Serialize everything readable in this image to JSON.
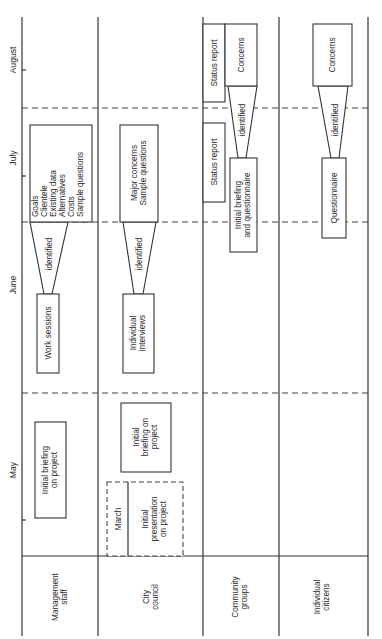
{
  "months": [
    "August",
    "July",
    "June",
    "May"
  ],
  "rows": {
    "management_staff": [
      "Management",
      "staff"
    ],
    "city_council": [
      "City",
      "council"
    ],
    "community_groups": [
      "Community",
      "groups"
    ],
    "individual_citizens": [
      "Individual",
      "citizens"
    ]
  },
  "management_staff": {
    "july_box": [
      "Goals",
      "Clientele",
      "Existing data",
      "Alternatives",
      "Costs",
      "Sample questions"
    ],
    "identified": "identified",
    "june_box": "Work sessions",
    "may_box": [
      "Initial briefing",
      "on project"
    ]
  },
  "city_council": {
    "july_box": [
      "Major concerns",
      "Sample questions"
    ],
    "identified": "identified",
    "june_box": [
      "Individual",
      "interviews"
    ],
    "may_box": [
      "Initial",
      "briefing on",
      "project"
    ],
    "march_label": "March",
    "march_box": [
      "Initial",
      "presentation",
      "on project"
    ]
  },
  "community_groups": {
    "status_report_august": "Status report",
    "concerns": "Concerns",
    "identified": "identified",
    "status_report_july": "Status report",
    "july_box": [
      "Initial briefing",
      "and questionnaire"
    ]
  },
  "individual_citizens": {
    "concerns": "Concerns",
    "identified": "identified",
    "july_box": "Questionnaire"
  }
}
